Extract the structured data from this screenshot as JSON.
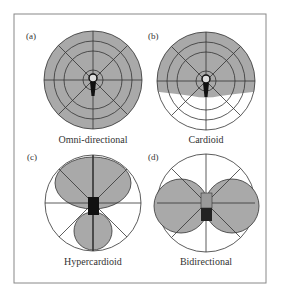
{
  "figure": {
    "colors": {
      "fill": "#a9a9a9",
      "stroke": "#333333",
      "frame": "#888888",
      "mic": "#111111",
      "background": "#ffffff"
    },
    "panels": [
      {
        "id": "a",
        "tag": "(a)",
        "caption": "Omni-directional",
        "pattern": "omnidirectional"
      },
      {
        "id": "b",
        "tag": "(b)",
        "caption": "Cardioid",
        "pattern": "cardioid"
      },
      {
        "id": "c",
        "tag": "(c)",
        "caption": "Hypercardioid",
        "pattern": "hypercardioid"
      },
      {
        "id": "d",
        "tag": "(d)",
        "caption": "Bidirectional",
        "pattern": "bidirectional"
      }
    ]
  }
}
